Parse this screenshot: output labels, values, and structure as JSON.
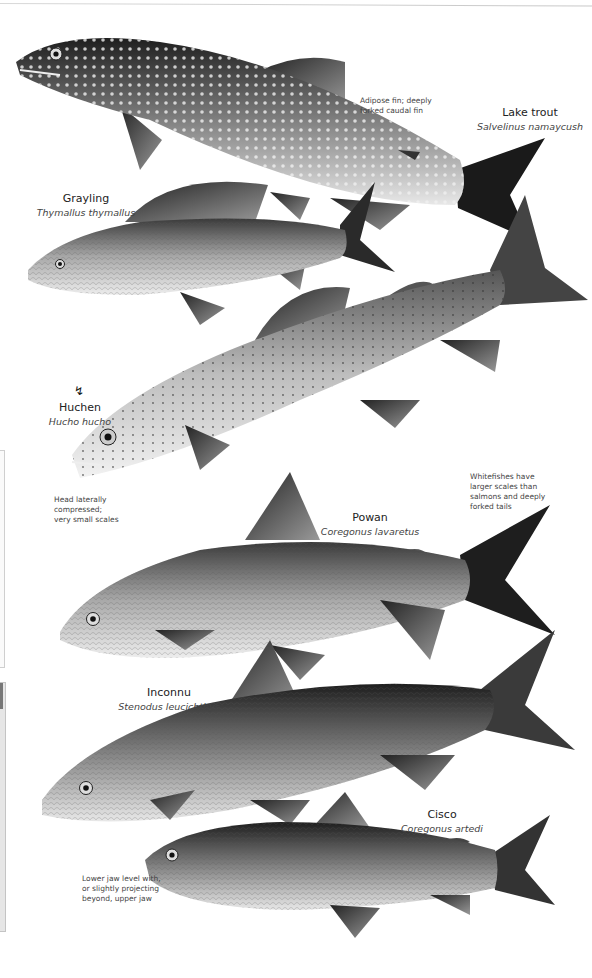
{
  "page": {
    "type": "illustrated field-guide page"
  },
  "species": [
    {
      "id": "lake-trout",
      "common_name": "Lake trout",
      "scientific_name": "Salvelinus namaycush"
    },
    {
      "id": "grayling",
      "common_name": "Grayling",
      "scientific_name": "Thymallus thymallus"
    },
    {
      "id": "huchen",
      "common_name": "Huchen",
      "scientific_name": "Hucho hucho"
    },
    {
      "id": "powan",
      "common_name": "Powan",
      "scientific_name": "Coregonus lavaretus"
    },
    {
      "id": "inconnu",
      "common_name": "Inconnu",
      "scientific_name": "Stenodus leucichthys"
    },
    {
      "id": "cisco",
      "common_name": "Cisco",
      "scientific_name": "Coregonus artedi"
    }
  ],
  "annotations": {
    "lake_trout_note": [
      "Adipose fin; deeply",
      "forked caudal fin"
    ],
    "huchen_note": [
      "Head laterally",
      "compressed;",
      "very small scales"
    ],
    "whitefish_note": [
      "Whitefishes have",
      "larger scales than",
      "salmons and deeply",
      "forked tails"
    ],
    "cisco_note": [
      "Lower jaw level with,",
      "or slightly projecting",
      "beyond, upper jaw"
    ]
  },
  "icons": {
    "huchen_marker": "endangered-mark"
  },
  "colors": {
    "background": "#ffffff",
    "ink": "#222222",
    "fish_dark": "#2a2a2a",
    "fish_mid": "#8a8a8a",
    "fish_light": "#e2e2e2"
  }
}
